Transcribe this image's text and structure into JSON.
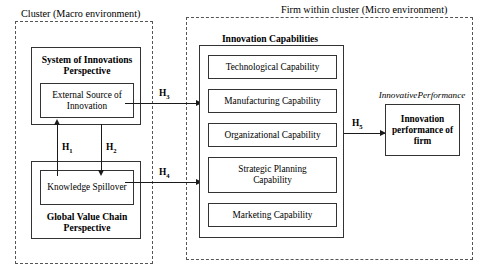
{
  "diagram": {
    "regions": [
      {
        "id": "macro",
        "label": "Cluster (Macro environment)"
      },
      {
        "id": "micro",
        "label": "Firm within cluster (Micro environment)"
      }
    ],
    "left_side": {
      "system_group": {
        "title": "System of Innovations Perspective",
        "inner_box": "External Source of Innovation"
      },
      "gvc_group": {
        "title": "Global Value Chain Perspective",
        "inner_box": "Knowledge Spillover"
      }
    },
    "right_side": {
      "capabilities_group": {
        "title": "Innovation Capabilities",
        "items": [
          "Technological Capability",
          "Manufacturing Capability",
          "Organizational Capability",
          "Strategic Planning Capability",
          "Marketing Capability"
        ]
      },
      "outcome": {
        "caption": "InnovativePerformance",
        "box": "Innovation performance of firm"
      }
    },
    "hypotheses": [
      {
        "id": "H1",
        "base": "H",
        "sub": "1"
      },
      {
        "id": "H2",
        "base": "H",
        "sub": "2"
      },
      {
        "id": "H3",
        "base": "H",
        "sub": "3"
      },
      {
        "id": "H4",
        "base": "H",
        "sub": "4"
      },
      {
        "id": "H5",
        "base": "H",
        "sub": "5"
      }
    ],
    "colors": {
      "ink": "#000000",
      "line": "#1a1a1a",
      "dashed": "#555555",
      "background": "#ffffff"
    }
  }
}
